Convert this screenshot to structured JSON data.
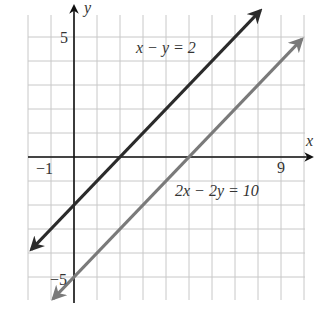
{
  "chart_data": {
    "type": "line",
    "title": "",
    "xlabel": "x",
    "ylabel": "y",
    "xlim": [
      -2,
      10
    ],
    "ylim": [
      -6,
      6
    ],
    "grid": true,
    "x_tick_labels": [
      {
        "value": -1,
        "label": "−1"
      },
      {
        "value": 9,
        "label": "9"
      }
    ],
    "y_tick_labels": [
      {
        "value": 5,
        "label": "5"
      },
      {
        "value": -5,
        "label": "−5"
      }
    ],
    "series": [
      {
        "name": "x − y = 2",
        "equation": "y = x - 2",
        "color": "#2b2b2b",
        "x": [
          -2,
          8
        ],
        "y": [
          -4,
          6
        ],
        "label_position": {
          "x": 2.6,
          "y": 4.5
        }
      },
      {
        "name": "2x − 2y = 10",
        "equation": "y = x - 5",
        "color": "#7a7a7a",
        "x": [
          -1,
          10
        ],
        "y": [
          -6,
          5
        ],
        "label_position": {
          "x": 4.4,
          "y": -1.5
        }
      }
    ]
  },
  "labels": {
    "x_axis": "x",
    "y_axis": "y",
    "tick_x_neg1": "−1",
    "tick_x_9": "9",
    "tick_y_5": "5",
    "tick_y_neg5": "−5",
    "line1": "x − y = 2",
    "line2": "2x − 2y = 10"
  }
}
